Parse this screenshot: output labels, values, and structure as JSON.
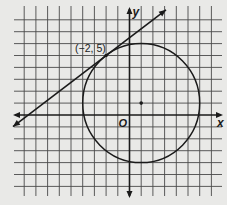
{
  "figure": {
    "background": "#e9e9e7",
    "grid_color": "#4a4a4a",
    "ink_color": "#1a1a1a",
    "labels": {
      "x_axis": "x",
      "y_axis": "y",
      "origin": "O",
      "tangent_point": "(−2, 5)"
    }
  },
  "chart_data": {
    "type": "diagram",
    "title": "",
    "xlabel": "x",
    "ylabel": "y",
    "grid": true,
    "xlim": [
      -10,
      8
    ],
    "ylim": [
      -7,
      9
    ],
    "grid_unit": 1,
    "origin_label": "O",
    "circle": {
      "center": [
        1,
        1
      ],
      "radius": 5,
      "center_marked": true
    },
    "tangent_line": {
      "through": [
        -2,
        5
      ],
      "slope": 0.75,
      "intercept": 6.5,
      "equation": "y = 0.75x + 6.5",
      "arrows": "both"
    },
    "points": [
      {
        "x": -2,
        "y": 5,
        "label": "(−2, 5)"
      },
      {
        "x": 1,
        "y": 1,
        "label": ""
      }
    ]
  }
}
